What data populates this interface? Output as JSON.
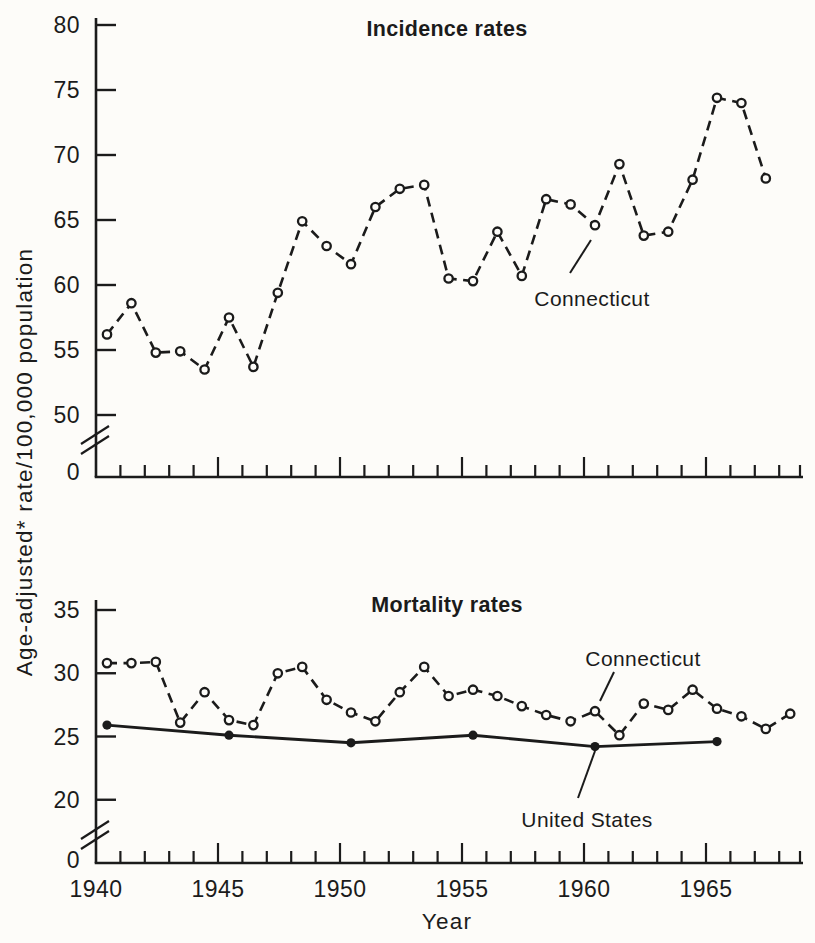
{
  "figure": {
    "ylabel": "Age-adjusted* rate/100,000 population",
    "xlabel": "Year",
    "xticks": [
      1940,
      1945,
      1950,
      1955,
      1960,
      1965
    ],
    "ink": "#1b1b1b",
    "paper": "#fdfcf9"
  },
  "chart_data": [
    {
      "type": "line",
      "title": "Incidence rates",
      "ylabel": "Age-adjusted* rate/100,000 population",
      "xlabel": "Year",
      "grid": false,
      "axis_break_above_zero": true,
      "ytick_zero": "0",
      "yticks": [
        50,
        55,
        60,
        65,
        70,
        75,
        80
      ],
      "ylim": [
        50,
        80
      ],
      "xlim": [
        1940,
        1969
      ],
      "series": [
        {
          "name": "Connecticut",
          "line": "dashed",
          "marker": "open-circle",
          "years": [
            1940,
            1941,
            1942,
            1943,
            1944,
            1945,
            1946,
            1947,
            1948,
            1949,
            1950,
            1951,
            1952,
            1953,
            1954,
            1955,
            1956,
            1957,
            1958,
            1959,
            1960,
            1961,
            1962,
            1963,
            1964,
            1965,
            1966,
            1967
          ],
          "values": [
            56.2,
            58.6,
            54.8,
            54.9,
            53.5,
            57.5,
            53.7,
            59.4,
            64.9,
            63.0,
            61.6,
            66.0,
            67.4,
            67.7,
            60.5,
            60.3,
            64.1,
            60.7,
            66.6,
            66.2,
            64.6,
            69.3,
            63.8,
            64.1,
            68.1,
            74.4,
            74.0,
            68.2
          ]
        }
      ],
      "annotations": [
        {
          "text": "Connecticut"
        }
      ]
    },
    {
      "type": "line",
      "title": "Mortality rates",
      "ylabel": "Age-adjusted* rate/100,000 population",
      "xlabel": "Year",
      "grid": false,
      "axis_break_above_zero": true,
      "ytick_zero": "0",
      "yticks": [
        20,
        25,
        30,
        35
      ],
      "ylim": [
        20,
        35
      ],
      "xlim": [
        1940,
        1969
      ],
      "series": [
        {
          "name": "Connecticut",
          "line": "dashed",
          "marker": "open-circle",
          "years": [
            1940,
            1941,
            1942,
            1943,
            1944,
            1945,
            1946,
            1947,
            1948,
            1949,
            1950,
            1951,
            1952,
            1953,
            1954,
            1955,
            1956,
            1957,
            1958,
            1959,
            1960,
            1961,
            1962,
            1963,
            1964,
            1965,
            1966,
            1967,
            1968
          ],
          "values": [
            30.8,
            30.8,
            30.9,
            26.1,
            28.5,
            26.3,
            25.9,
            30.0,
            30.5,
            27.9,
            26.9,
            26.2,
            28.5,
            30.5,
            28.2,
            28.7,
            28.2,
            27.4,
            26.7,
            26.2,
            27.0,
            25.1,
            27.6,
            27.1,
            28.7,
            27.2,
            26.6,
            25.6,
            26.8
          ]
        },
        {
          "name": "United States",
          "line": "solid",
          "marker": "filled-circle",
          "years": [
            1940,
            1945,
            1950,
            1955,
            1960,
            1965
          ],
          "values": [
            25.9,
            25.1,
            24.5,
            25.1,
            24.2,
            24.6
          ]
        }
      ],
      "annotations": [
        {
          "text": "Connecticut"
        },
        {
          "text": "United States"
        }
      ]
    }
  ]
}
